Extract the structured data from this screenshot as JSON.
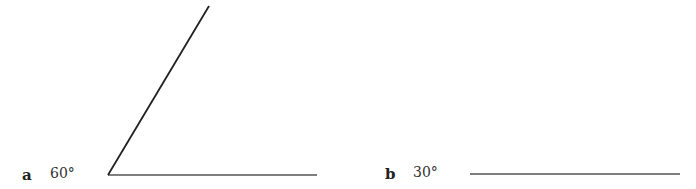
{
  "items": [
    {
      "letter": "a",
      "angle": "60°",
      "degrees": 60
    },
    {
      "letter": "b",
      "angle": "30°",
      "degrees": 30
    }
  ],
  "colors": {
    "line": "#333333",
    "text": "#333333"
  }
}
